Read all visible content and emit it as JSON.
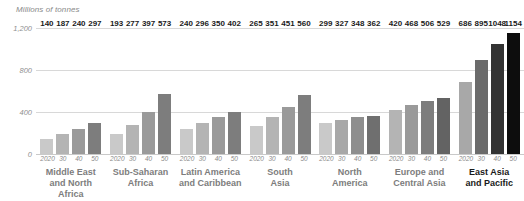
{
  "chart_data": {
    "type": "bar",
    "title": "",
    "subtitle": "",
    "ylabel": "Millions of tonnes",
    "xlabel": "",
    "ylim": [
      0,
      1200
    ],
    "yticks": [
      "0",
      "400",
      "800",
      "1,200"
    ],
    "ytick_values": [
      0,
      400,
      800,
      1200
    ],
    "grid": true,
    "legend": "none",
    "categories": [
      "2020",
      "30",
      "40",
      "50"
    ],
    "groups": [
      {
        "label_line1": "Middle East",
        "label_line2": "and North Africa",
        "emphasis": false,
        "ticks": [
          "2020",
          "30",
          "40",
          "50"
        ],
        "values": [
          140,
          187,
          240,
          297
        ],
        "labels": [
          "140",
          "187",
          "240",
          "297"
        ],
        "colors": [
          "#c9c9c9",
          "#b4b4b4",
          "#9a9a9a",
          "#7d7d7d"
        ]
      },
      {
        "label_line1": "Sub-Saharan",
        "label_line2": "Africa",
        "emphasis": false,
        "ticks": [
          "2020",
          "30",
          "40",
          "50"
        ],
        "values": [
          193,
          277,
          397,
          573
        ],
        "labels": [
          "193",
          "277",
          "397",
          "573"
        ],
        "colors": [
          "#c9c9c9",
          "#b4b4b4",
          "#9a9a9a",
          "#7d7d7d"
        ]
      },
      {
        "label_line1": "Latin America",
        "label_line2": "and Caribbean",
        "emphasis": false,
        "ticks": [
          "2020",
          "30",
          "40",
          "50"
        ],
        "values": [
          240,
          296,
          350,
          402
        ],
        "labels": [
          "240",
          "296",
          "350",
          "402"
        ],
        "colors": [
          "#c9c9c9",
          "#b4b4b4",
          "#9a9a9a",
          "#7d7d7d"
        ]
      },
      {
        "label_line1": "South",
        "label_line2": "Asia",
        "emphasis": false,
        "ticks": [
          "2020",
          "30",
          "40",
          "50"
        ],
        "values": [
          265,
          351,
          451,
          560
        ],
        "labels": [
          "265",
          "351",
          "451",
          "560"
        ],
        "colors": [
          "#c9c9c9",
          "#b4b4b4",
          "#9a9a9a",
          "#7d7d7d"
        ]
      },
      {
        "label_line1": "North",
        "label_line2": "America",
        "emphasis": false,
        "ticks": [
          "2020",
          "30",
          "40",
          "50"
        ],
        "values": [
          299,
          327,
          348,
          362
        ],
        "labels": [
          "299",
          "327",
          "348",
          "362"
        ],
        "colors": [
          "#c9c9c9",
          "#a8a8a8",
          "#8e8e8e",
          "#6f6f6f"
        ]
      },
      {
        "label_line1": "Europe and",
        "label_line2": "Central Asia",
        "emphasis": false,
        "ticks": [
          "2020",
          "30",
          "40",
          "50"
        ],
        "values": [
          420,
          468,
          506,
          529
        ],
        "labels": [
          "420",
          "468",
          "506",
          "529"
        ],
        "colors": [
          "#b4b4b4",
          "#9a9a9a",
          "#7d7d7d",
          "#636363"
        ]
      },
      {
        "label_line1": "East Asia",
        "label_line2": "and Pacific",
        "emphasis": true,
        "ticks": [
          "2020",
          "30",
          "40",
          "50"
        ],
        "values": [
          686,
          895,
          1048,
          1154
        ],
        "labels": [
          "686",
          "895",
          "1048",
          "1154"
        ],
        "colors": [
          "#a8a8a8",
          "#6b6b6b",
          "#333333",
          "#0d0d0d"
        ]
      }
    ]
  }
}
